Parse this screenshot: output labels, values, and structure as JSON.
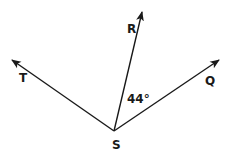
{
  "diagram": {
    "type": "geometry-angle-rays",
    "stroke_color": "#1a1a1a",
    "background": "#ffffff",
    "vertex": {
      "label": "S",
      "x": 114,
      "y": 131,
      "label_x": 112,
      "label_y": 149
    },
    "rays": [
      {
        "name": "T",
        "label": "T",
        "tip_x": 12,
        "tip_y": 60,
        "label_x": 19,
        "label_y": 82
      },
      {
        "name": "R",
        "label": "R",
        "tip_x": 142,
        "tip_y": 12,
        "label_x": 127,
        "label_y": 33
      },
      {
        "name": "Q",
        "label": "Q",
        "tip_x": 219,
        "tip_y": 60,
        "label_x": 205,
        "label_y": 85
      }
    ],
    "angle_label": {
      "text": "44°",
      "between": [
        "R",
        "Q"
      ],
      "x": 127,
      "y": 103
    }
  }
}
